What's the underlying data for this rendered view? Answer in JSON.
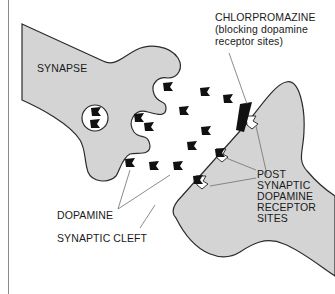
{
  "diagram": {
    "title_cut_off": "",
    "labels": {
      "synapse": "SYNAPSE",
      "chlorpromazine_line1": "CHLORPROMAZINE",
      "chlorpromazine_line2": "(blocking dopamine",
      "chlorpromazine_line3": "receptor sites)",
      "dopamine": "DOPAMINE",
      "synaptic_cleft": "SYNAPTIC CLEFT",
      "receptor_line1": "POST",
      "receptor_line2": "SYNAPTIC",
      "receptor_line3": "DOPAMINE",
      "receptor_line4": "RECEPTOR",
      "receptor_line5": "SITES"
    },
    "colors": {
      "cell_fill": "#d4d4d4",
      "outline": "#2b2b2b",
      "molecule": "#111111",
      "leader_line": "#6e6e6e"
    },
    "elements": [
      "presynaptic-terminal",
      "synaptic-vesicle",
      "dopamine-molecules",
      "chlorpromazine-blocker",
      "postsynaptic-membrane",
      "receptor-sites"
    ]
  }
}
